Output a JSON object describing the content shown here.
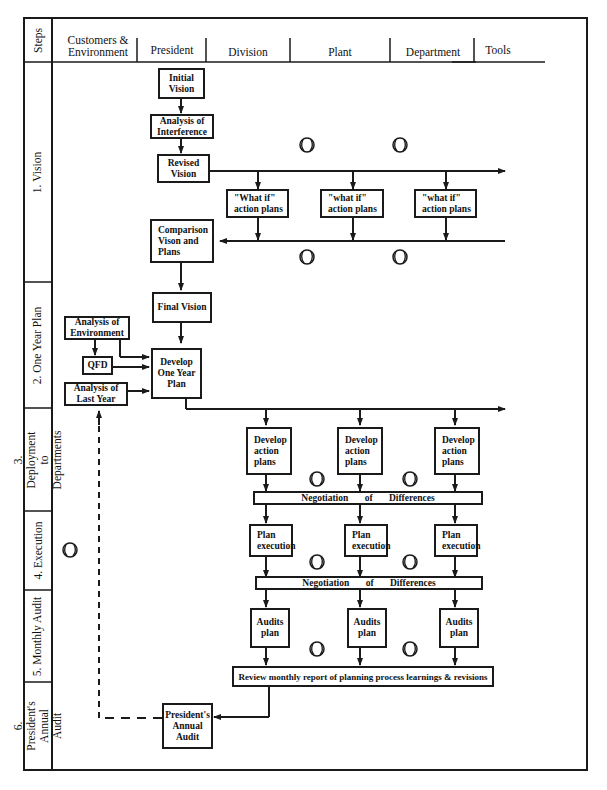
{
  "header": {
    "steps_label": "Steps",
    "columns": [
      {
        "label": "Customers &\nEnvironment"
      },
      {
        "label": "President"
      },
      {
        "label": "Division"
      },
      {
        "label": "Plant"
      },
      {
        "label": "Department"
      },
      {
        "label": "Tools"
      }
    ]
  },
  "steps": [
    {
      "label": "1. Vision"
    },
    {
      "label": "2. One Year Plan"
    },
    {
      "label": "3. Deployment\nto Departments"
    },
    {
      "label": "4. Execution"
    },
    {
      "label": "5. Monthly Audit"
    },
    {
      "label": "6. President's\nAnnual Audit"
    }
  ],
  "vision": {
    "initial_vision": "Initial\nVision",
    "analysis_interference": "Analysis of\nInterference",
    "revised_vision": "Revised\nVision",
    "what_if_division": "\"What if\"\naction plans",
    "what_if_plant": "\"what if\"\naction plans",
    "what_if_department": "\"what if\"\naction plans",
    "comparison": "Comparison\nVison and\nPlans"
  },
  "one_year_plan": {
    "final_vision": "Final  Vision",
    "analysis_environment": "Analysis of\nEnvironment",
    "qfd": "QFD",
    "analysis_last_year": "Analysis of\nLast Year",
    "develop_one_year_plan": "Develop\nOne Year\nPlan"
  },
  "deployment": {
    "develop_action_plans": [
      "Develop\naction\nplans",
      "Develop\naction\nplans",
      "Develop\naction\nplans"
    ],
    "negotiation": "Negotiation of Differences"
  },
  "execution": {
    "plan_execution": [
      "Plan\nexecution",
      "Plan\nexecution",
      "Plan\nexecution"
    ],
    "negotiation": "Negotiation of Differences"
  },
  "monthly_audit": {
    "audits_plan": [
      "Audits\nplan",
      "Audits\nplan",
      "Audits\nplan"
    ],
    "review": "Review monthly report of planning process learnings & revisions"
  },
  "annual_audit": {
    "presidents_annual_audit": "President's\nAnnual\nAudit"
  },
  "symbols": {
    "pdca_icon": "circle-with-arcs"
  },
  "colors": {
    "line": "#1a1a1a",
    "background": "#ffffff"
  }
}
